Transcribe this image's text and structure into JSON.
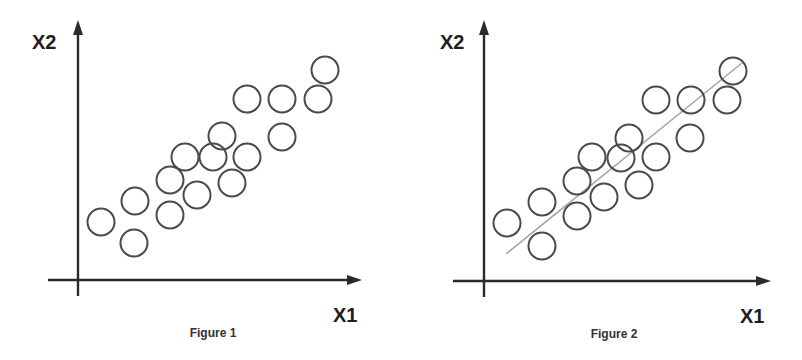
{
  "colors": {
    "axis": "#2a2a2a",
    "points": "#4a4a4a",
    "fit_line": "#a8a8a8",
    "background": "#ffffff"
  },
  "figures": [
    {
      "caption": "Figure 1",
      "x_label": "X1",
      "y_label": "X2",
      "has_fit_line": false
    },
    {
      "caption": "Figure 2",
      "x_label": "X1",
      "y_label": "X2",
      "has_fit_line": true
    }
  ],
  "chart_data": [
    {
      "type": "scatter",
      "title": "Figure 1",
      "xlabel": "X1",
      "ylabel": "X2",
      "grid": false,
      "ticks": false,
      "marker": "hollow-circle",
      "points": [
        {
          "x": 1.0,
          "y": 2.6
        },
        {
          "x": 2.2,
          "y": 3.4
        },
        {
          "x": 2.2,
          "y": 1.6
        },
        {
          "x": 3.3,
          "y": 4.3
        },
        {
          "x": 3.3,
          "y": 2.8
        },
        {
          "x": 3.8,
          "y": 5.3
        },
        {
          "x": 4.2,
          "y": 3.6
        },
        {
          "x": 4.8,
          "y": 5.3
        },
        {
          "x": 5.1,
          "y": 6.1
        },
        {
          "x": 5.5,
          "y": 4.2
        },
        {
          "x": 6.0,
          "y": 5.3
        },
        {
          "x": 6.0,
          "y": 7.7
        },
        {
          "x": 7.1,
          "y": 7.7
        },
        {
          "x": 7.1,
          "y": 6.1
        },
        {
          "x": 8.3,
          "y": 7.7
        },
        {
          "x": 8.5,
          "y": 8.9
        }
      ]
    },
    {
      "type": "scatter",
      "title": "Figure 2",
      "xlabel": "X1",
      "ylabel": "X2",
      "grid": false,
      "ticks": false,
      "marker": "hollow-circle",
      "points": [
        {
          "x": 1.0,
          "y": 2.6
        },
        {
          "x": 2.2,
          "y": 3.4
        },
        {
          "x": 2.2,
          "y": 1.6
        },
        {
          "x": 3.3,
          "y": 4.3
        },
        {
          "x": 3.3,
          "y": 2.8
        },
        {
          "x": 3.8,
          "y": 5.3
        },
        {
          "x": 4.2,
          "y": 3.6
        },
        {
          "x": 4.8,
          "y": 5.3
        },
        {
          "x": 5.1,
          "y": 6.1
        },
        {
          "x": 5.5,
          "y": 4.2
        },
        {
          "x": 6.0,
          "y": 5.3
        },
        {
          "x": 6.0,
          "y": 7.7
        },
        {
          "x": 7.1,
          "y": 7.7
        },
        {
          "x": 7.1,
          "y": 6.1
        },
        {
          "x": 8.3,
          "y": 7.7
        },
        {
          "x": 8.5,
          "y": 8.9
        }
      ],
      "fit_line": {
        "x0": 1.0,
        "y0": 1.2,
        "x1": 8.8,
        "y1": 9.2,
        "color": "#a8a8a8"
      }
    }
  ],
  "layout": {
    "panels": [
      {
        "y_axis": {
          "x": 78,
          "y_top": 20,
          "y_bottom": 296
        },
        "x_axis": {
          "y": 280,
          "x_left": 48,
          "x_right": 362
        },
        "y_label_pos": {
          "x": 32,
          "y": 49
        },
        "x_label_pos": {
          "x": 333,
          "y": 322
        },
        "caption_pos": {
          "x": 213,
          "y": 337
        },
        "radius": 13.5,
        "circles": [
          [
            101,
            222
          ],
          [
            135,
            201
          ],
          [
            134,
            243
          ],
          [
            170,
            180
          ],
          [
            170,
            215
          ],
          [
            185,
            157
          ],
          [
            197,
            195
          ],
          [
            213,
            157
          ],
          [
            222,
            136
          ],
          [
            232,
            183
          ],
          [
            247,
            157
          ],
          [
            247,
            99
          ],
          [
            282,
            99
          ],
          [
            282,
            137
          ],
          [
            318,
            99
          ],
          [
            325,
            70
          ]
        ]
      },
      {
        "y_axis": {
          "x": 484,
          "y_top": 20,
          "y_bottom": 297
        },
        "x_axis": {
          "y": 281,
          "x_left": 453,
          "x_right": 771
        },
        "y_label_pos": {
          "x": 440,
          "y": 49
        },
        "x_label_pos": {
          "x": 740,
          "y": 323
        },
        "caption_pos": {
          "x": 614,
          "y": 338
        },
        "radius": 13.5,
        "circles": [
          [
            507,
            223
          ],
          [
            542,
            202
          ],
          [
            542,
            246
          ],
          [
            577,
            181
          ],
          [
            577,
            216
          ],
          [
            592,
            157
          ],
          [
            604,
            197
          ],
          [
            621,
            158
          ],
          [
            629,
            138
          ],
          [
            639,
            185
          ],
          [
            656,
            157
          ],
          [
            656,
            100
          ],
          [
            691,
            100
          ],
          [
            690,
            138
          ],
          [
            727,
            100
          ],
          [
            733,
            71
          ]
        ],
        "fit_line": [
          [
            506,
            254
          ],
          [
            742,
            63
          ]
        ]
      }
    ]
  }
}
